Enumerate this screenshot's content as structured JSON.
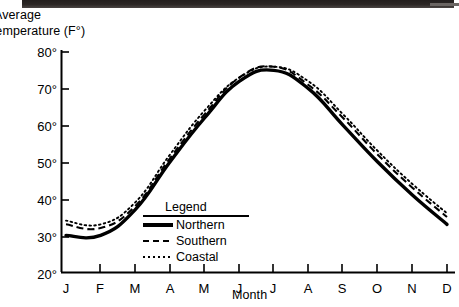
{
  "chart_data": {
    "type": "line",
    "title": "",
    "ylabel_line1": "Average",
    "ylabel_line2": "Temperature (F°)",
    "xlabel": "Month",
    "categories": [
      "J",
      "F",
      "M",
      "A",
      "M",
      "J",
      "J",
      "A",
      "S",
      "O",
      "N",
      "D"
    ],
    "category_names": [
      "January",
      "February",
      "March",
      "April",
      "May",
      "June",
      "July",
      "August",
      "September",
      "October",
      "November",
      "December"
    ],
    "y_ticks": [
      "20°",
      "30°",
      "40°",
      "50°",
      "60°",
      "70°",
      "80°"
    ],
    "y_tick_values": [
      20,
      30,
      40,
      50,
      60,
      70,
      80
    ],
    "ylim": [
      20,
      80
    ],
    "grid": false,
    "legend_position": "inside-lower-center",
    "legend_title": "Legend",
    "series": [
      {
        "name": "Northern",
        "style": "solid",
        "values": [
          30,
          30,
          37,
          50,
          62,
          72,
          75,
          70,
          60,
          50,
          41,
          33
        ]
      },
      {
        "name": "Southern",
        "style": "dashed",
        "values": [
          33,
          32,
          38,
          51,
          63,
          73,
          76,
          71,
          62,
          52,
          43,
          35
        ]
      },
      {
        "name": "Coastal",
        "style": "dotted",
        "values": [
          34,
          33,
          39,
          52,
          64,
          73,
          76,
          72,
          63,
          53,
          44,
          36
        ]
      }
    ]
  },
  "legend": {
    "title": "Legend",
    "entries": [
      {
        "label": "Northern",
        "style": "solid"
      },
      {
        "label": "Southern",
        "style": "dashed"
      },
      {
        "label": "Coastal",
        "style": "dotted"
      }
    ]
  }
}
